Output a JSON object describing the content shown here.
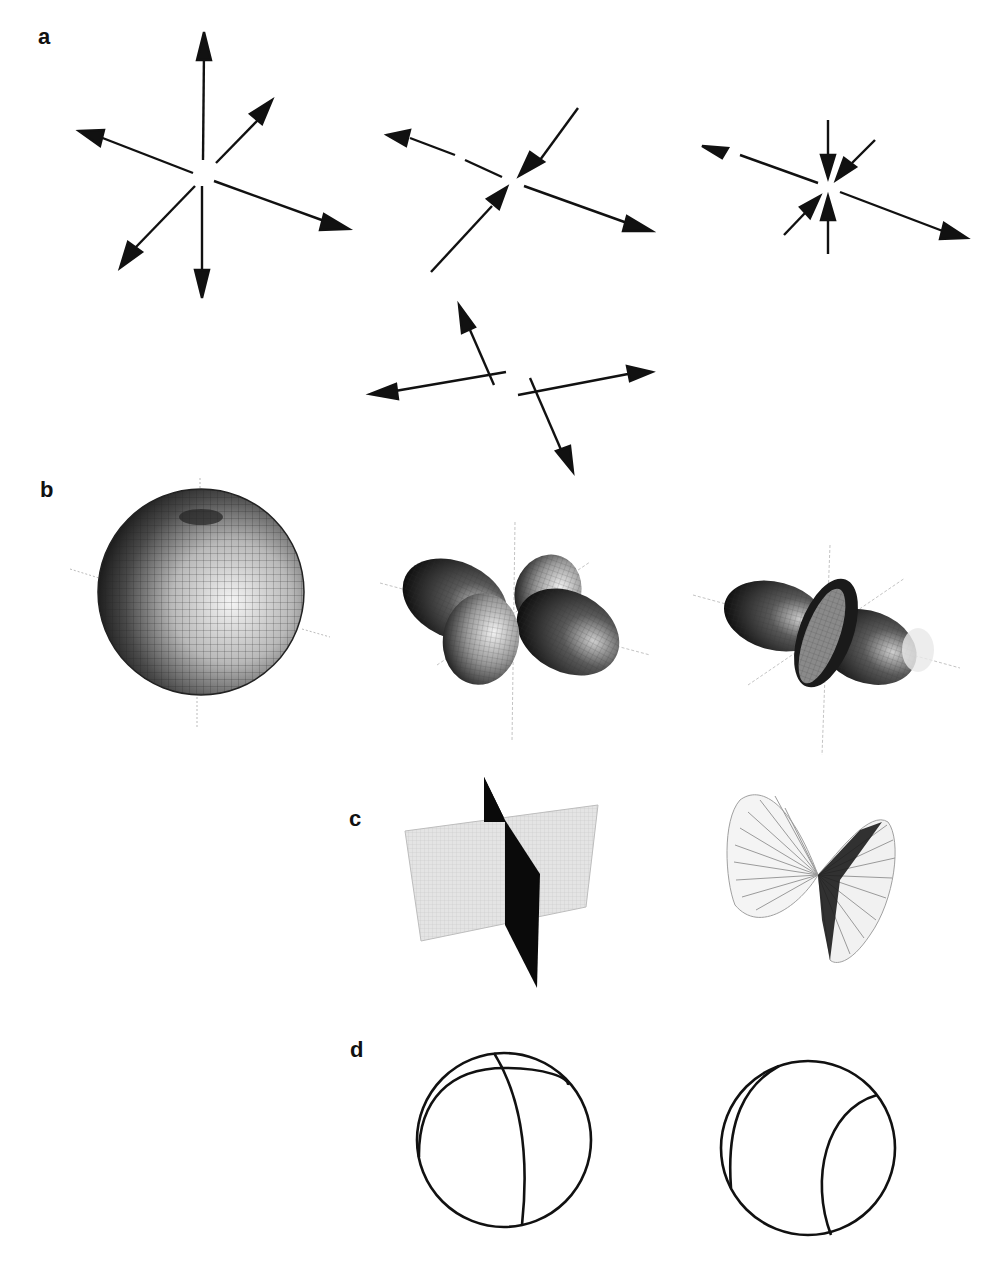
{
  "figure": {
    "panels": [
      {
        "id": "a",
        "label": "a",
        "description": "Force couple / moment tensor arrow diagrams"
      },
      {
        "id": "b",
        "label": "b",
        "description": "3-D radiation pattern surfaces"
      },
      {
        "id": "c",
        "label": "c",
        "description": "Fault plane representations"
      },
      {
        "id": "d",
        "label": "d",
        "description": "Focal-sphere beachball outlines"
      }
    ],
    "panel_a": {
      "diagrams": [
        {
          "name": "isotropic-explosion",
          "arrows": "six outward"
        },
        {
          "name": "clvd-tension",
          "arrows": "two outward, two inward"
        },
        {
          "name": "clvd-compression",
          "arrows": "two outward, four inward"
        },
        {
          "name": "double-couple",
          "arrows": "two force couples"
        }
      ]
    },
    "panel_b": {
      "surfaces": [
        {
          "name": "sphere"
        },
        {
          "name": "four-lobe-pattern"
        },
        {
          "name": "clvd-pattern"
        }
      ]
    },
    "panel_c": {
      "items": [
        {
          "name": "orthogonal-planes"
        },
        {
          "name": "cone-surfaces"
        }
      ]
    },
    "panel_d": {
      "items": [
        {
          "name": "beachball-double-couple"
        },
        {
          "name": "beachball-clvd"
        }
      ]
    },
    "colors": {
      "ink": "#111111",
      "axis": "#bbbbbb",
      "plane_light": "#e2e2e2",
      "plane_dark": "#0a0a0a"
    }
  }
}
